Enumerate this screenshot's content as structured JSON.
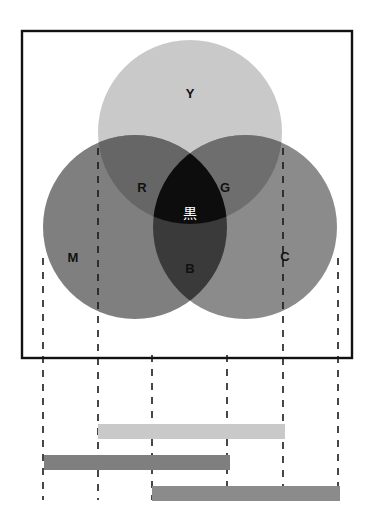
{
  "figure": {
    "title_text": "",
    "frame": {
      "x": 22,
      "y": 31,
      "width": 330,
      "height": 327,
      "stroke": "#111111",
      "stroke_width": 2.4,
      "fill": "#ffffff"
    },
    "background": "#ffffff"
  },
  "chart_data": {
    "type": "diagram",
    "subtype": "venn-subtractive-color",
    "title": "",
    "xlabel": "",
    "ylabel": "",
    "grid": false,
    "legend": "none",
    "circles": [
      {
        "id": "Y",
        "label": "Y",
        "cx": 190,
        "cy": 132,
        "r": 92,
        "color": "#c9c9c9",
        "label_x": 190,
        "label_y": 95
      },
      {
        "id": "M",
        "label": "M",
        "cx": 135,
        "cy": 227,
        "r": 92,
        "color": "#7f7f7f",
        "label_x": 73,
        "label_y": 259
      },
      {
        "id": "C",
        "label": "C",
        "cx": 245,
        "cy": 227,
        "r": 92,
        "color": "#8b8b8b",
        "label_x": 285,
        "label_y": 258
      }
    ],
    "overlaps": [
      {
        "id": "R",
        "label": "R",
        "pair": [
          "Y",
          "M"
        ],
        "color": "#666666",
        "label_x": 142,
        "label_y": 189
      },
      {
        "id": "G",
        "label": "G",
        "pair": [
          "Y",
          "C"
        ],
        "color": "#6e6e6e",
        "label_x": 225,
        "label_y": 189
      },
      {
        "id": "B",
        "label": "B",
        "pair": [
          "M",
          "C"
        ],
        "color": "#3a3a3a",
        "label_x": 190,
        "label_y": 270
      },
      {
        "id": "K",
        "label": "黒",
        "pair": [
          "Y",
          "M",
          "C"
        ],
        "color": "#0d0d0d",
        "label_x": 190,
        "label_y": 214
      }
    ],
    "guide_lines": [
      {
        "id": "g1",
        "x": 43,
        "y1": 258,
        "y2": 500
      },
      {
        "id": "g2",
        "x": 98,
        "y1": 148,
        "y2": 500
      },
      {
        "id": "g3",
        "x": 152,
        "y1": 355,
        "y2": 500
      },
      {
        "id": "g4",
        "x": 227,
        "y1": 355,
        "y2": 500
      },
      {
        "id": "g5",
        "x": 283,
        "y1": 148,
        "y2": 500
      },
      {
        "id": "g6",
        "x": 338,
        "y1": 258,
        "y2": 500
      }
    ],
    "guide_style": {
      "color": "#1a1a1a",
      "width": 1.6,
      "dash": "7 7"
    },
    "bars": [
      {
        "id": "bar-Y",
        "label": "Y",
        "x_start": 98,
        "x_end": 285,
        "y": 424,
        "height": 15,
        "color": "#c9c9c9"
      },
      {
        "id": "bar-M",
        "label": "M",
        "x_start": 44,
        "x_end": 230,
        "y": 455,
        "height": 15,
        "color": "#7f7f7f"
      },
      {
        "id": "bar-C",
        "label": "C",
        "x_start": 152,
        "x_end": 340,
        "y": 486,
        "height": 15,
        "color": "#8b8b8b"
      }
    ],
    "axis_range_x": [
      22,
      352
    ]
  }
}
